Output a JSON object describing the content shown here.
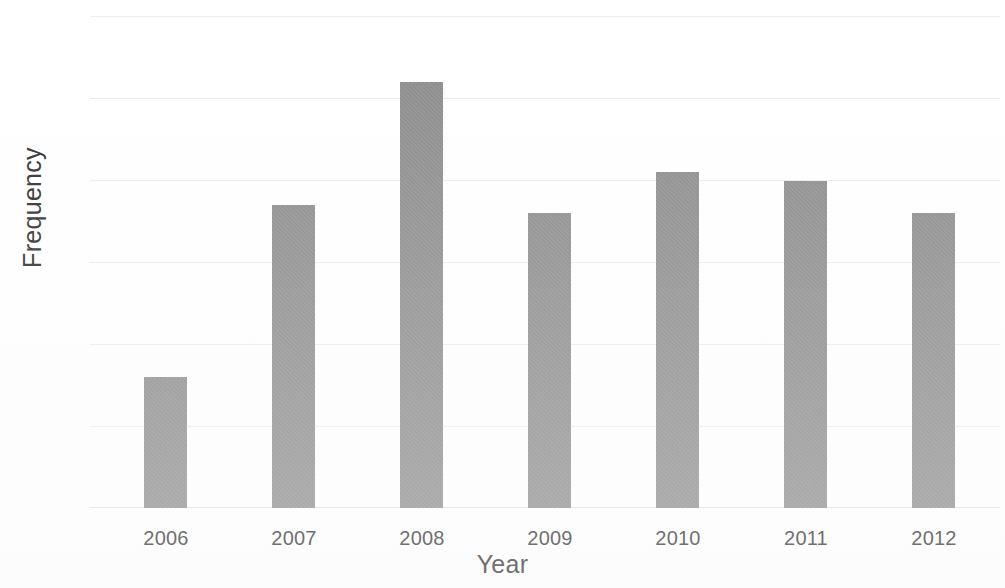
{
  "chart_data": {
    "type": "bar",
    "title": "",
    "subtitle": "",
    "xlabel": "Year",
    "ylabel": "Frequency",
    "categories": [
      "2006",
      "2007",
      "2008",
      "2009",
      "2010",
      "2011",
      "2012"
    ],
    "values": [
      16,
      37,
      52,
      36,
      41,
      40,
      36
    ],
    "series": [
      {
        "name": "Frequency",
        "values": [
          16,
          37,
          52,
          36,
          41,
          40,
          36
        ]
      }
    ],
    "ylim": [
      0,
      60
    ],
    "ytick_labels": [
      "0",
      "10",
      "20",
      "30",
      "40",
      "50",
      "60"
    ],
    "ytick_values": [
      0,
      10,
      20,
      30,
      40,
      50,
      60
    ],
    "xtick_labels": [
      "2006",
      "2007",
      "2008",
      "2009",
      "2010",
      "2011",
      "2012"
    ],
    "grid": "horizontal",
    "legend": "none",
    "bar_color": "#8c8c8c",
    "gridline_color": "#ececec",
    "background_color": "#ffffff",
    "text_color": "#2b2b2b",
    "annotations": []
  }
}
